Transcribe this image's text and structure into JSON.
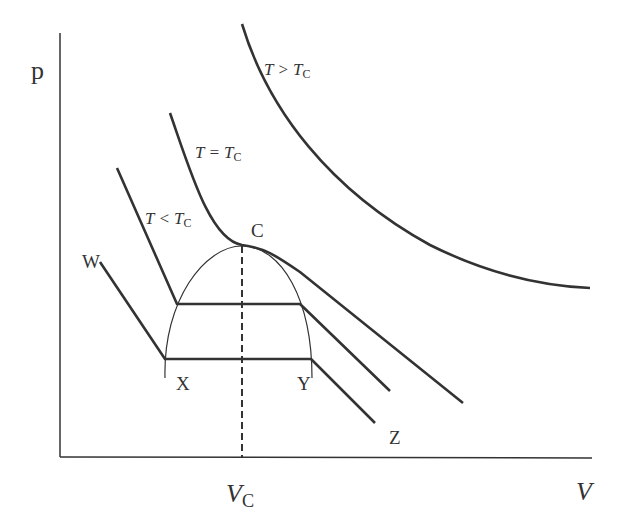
{
  "diagram": {
    "type": "p-V isotherms of a real gas (Andrews diagram)",
    "axes": {
      "y_label": "p",
      "x_label": "V",
      "x_marker": {
        "symbol": "V",
        "subscript": "C"
      }
    },
    "isotherms": [
      {
        "id": "above-critical",
        "relation": "T > T",
        "subscript": "C"
      },
      {
        "id": "critical",
        "relation": "T = T",
        "subscript": "C"
      },
      {
        "id": "below-critical",
        "relation": "T < T",
        "subscript": "C"
      }
    ],
    "points": {
      "critical": "C",
      "w": "W",
      "x": "X",
      "y": "Y",
      "z": "Z"
    },
    "colors": {
      "line": "#333333",
      "background": "#ffffff"
    }
  }
}
